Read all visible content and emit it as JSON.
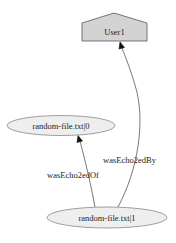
{
  "graph": {
    "nodes": [
      {
        "id": "user1",
        "label": "User1",
        "shape": "house",
        "fill": "#d3d3d3"
      },
      {
        "id": "file0",
        "label": "random-file.txt|0",
        "shape": "ellipse",
        "fill": "#eeeeee"
      },
      {
        "id": "file1",
        "label": "random-file.txt|1",
        "shape": "ellipse",
        "fill": "#eeeeee"
      }
    ],
    "edges": [
      {
        "from": "file1",
        "to": "file0",
        "label": "wasEcho2edOf"
      },
      {
        "from": "file1",
        "to": "user1",
        "label": "wasEcho2edBy"
      }
    ]
  }
}
